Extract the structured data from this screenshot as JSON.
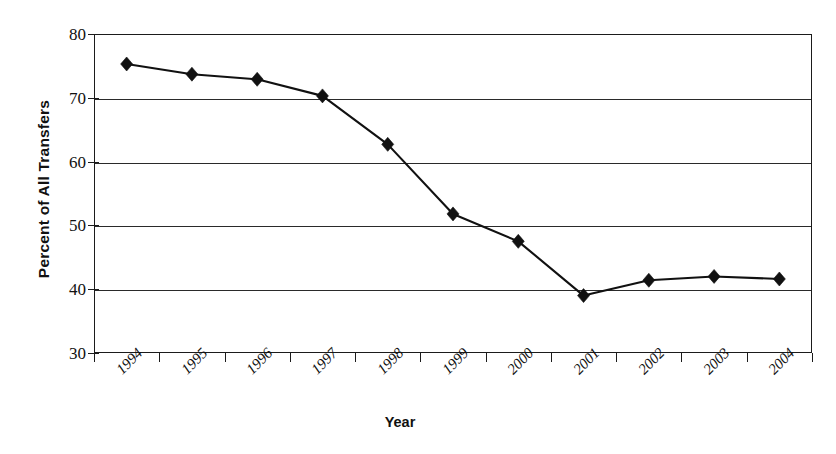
{
  "chart_data": {
    "type": "line",
    "title": "",
    "subtitle": "",
    "xlabel": "Year",
    "ylabel": "Percent of All Transfers",
    "categories": [
      "1994",
      "1995",
      "1996",
      "1997",
      "1998",
      "1999",
      "2000",
      "2001",
      "2002",
      "2003",
      "2004"
    ],
    "values": [
      75.3,
      73.7,
      72.9,
      70.3,
      62.7,
      51.8,
      47.5,
      39.0,
      41.4,
      42.0,
      41.6
    ],
    "series": [
      {
        "name": "Percent of All Transfers",
        "values": [
          75.3,
          73.7,
          72.9,
          70.3,
          62.7,
          51.8,
          47.5,
          39.0,
          41.4,
          42.0,
          41.6
        ]
      }
    ],
    "ylim": [
      30,
      80
    ],
    "yticks": [
      30,
      40,
      50,
      60,
      70,
      80
    ],
    "ytick_labels": [
      "30",
      "40",
      "50",
      "60",
      "70",
      "80"
    ],
    "grid": "horizontal",
    "legend": "none",
    "marker": "diamond",
    "line_color": "#111111",
    "marker_color": "#111111",
    "grid_color": "#2a2a2a",
    "axis_color": "#1b1b1b",
    "background_color": "#ffffff",
    "xtick_label_rotation": "-45"
  },
  "axes": {
    "y_title": "Percent of All Transfers",
    "x_title": "Year"
  }
}
